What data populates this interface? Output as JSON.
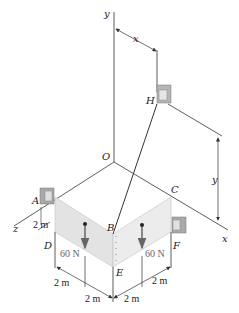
{
  "figure": {
    "axes": {
      "y": "y",
      "x": "x",
      "z": "z",
      "origin": "O"
    },
    "points": {
      "A": "A",
      "B": "B",
      "C": "C",
      "D": "D",
      "E": "E",
      "F": "F",
      "H": "H"
    },
    "loads": [
      {
        "label": "60 N",
        "value": 60,
        "unit": "N"
      },
      {
        "label": "60 N",
        "value": 60,
        "unit": "N"
      }
    ],
    "dimensions": {
      "AD": "2 m",
      "bottom_left_1": "2 m",
      "bottom_left_2": "2 m",
      "bottom_right_1": "2 m",
      "bottom_right_2": "2 m",
      "H_x": "x",
      "H_y": "y"
    },
    "colors": {
      "line": "#333333",
      "plate": "#e6e6e6",
      "support": "#a9a9a9",
      "load_arrow": "#666666"
    }
  }
}
